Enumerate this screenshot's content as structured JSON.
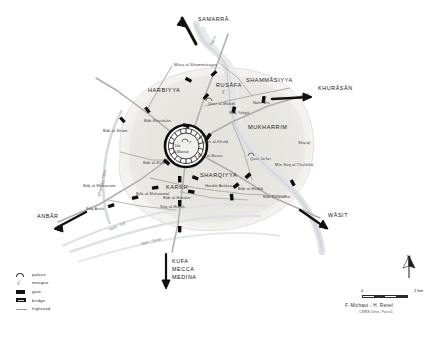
{
  "map": {
    "title": "Baghdad - Round City of al-Mansur",
    "central_city": {
      "name_line1": "Dār",
      "name_line2": "al-Mansūr"
    },
    "districts": [
      {
        "label": "HARBIYYA",
        "x": 150,
        "y": 91
      },
      {
        "label": "RUSĀFA",
        "x": 219,
        "y": 86
      },
      {
        "label": "SHAMMĀSIYYA",
        "x": 249,
        "y": 81
      },
      {
        "label": "MUKHARRIM",
        "x": 250,
        "y": 128
      },
      {
        "label": "SHARQIYYA",
        "x": 201,
        "y": 176
      },
      {
        "label": "KARKH",
        "x": 168,
        "y": 188
      }
    ],
    "destinations": [
      {
        "label": "SAMARRĀ",
        "x": 200,
        "y": 20
      },
      {
        "label": "KHURĀSĀN",
        "x": 321,
        "y": 89
      },
      {
        "label": "WĀSIT",
        "x": 331,
        "y": 216
      },
      {
        "label": "ANBĀR",
        "x": 39,
        "y": 217
      },
      {
        "label": "KUFA",
        "x": 172,
        "y": 261
      },
      {
        "label": "MECCA",
        "x": 172,
        "y": 269
      },
      {
        "label": "MEDINA",
        "x": 172,
        "y": 277
      }
    ],
    "places": [
      {
        "label": "Bāb al-Shām",
        "x": 105,
        "y": 131
      },
      {
        "label": "Bāb Khurāsān",
        "x": 146,
        "y": 121
      },
      {
        "label": "Bāb al-Kūfa",
        "x": 145,
        "y": 163
      },
      {
        "label": "Bāb al-Basra",
        "x": 199,
        "y": 156
      },
      {
        "label": "Qasr al-Khuld",
        "x": 203,
        "y": 142
      },
      {
        "label": "Qasr al-Mahdī",
        "x": 209,
        "y": 104
      },
      {
        "label": "Qasr Ja'far",
        "x": 252,
        "y": 159
      },
      {
        "label": "Bāb al-Muhawwal",
        "x": 139,
        "y": 194
      },
      {
        "label": "Bāb al-Harrāni",
        "x": 164,
        "y": 198
      },
      {
        "label": "Mūsa al-Shammāsiyya",
        "x": 176,
        "y": 65
      },
      {
        "label": "Sūq Yahyā",
        "x": 231,
        "y": 113
      },
      {
        "label": "Nahr Bīn",
        "x": 255,
        "y": 103
      },
      {
        "label": "Mīn Sūq al-Thulāthā",
        "x": 277,
        "y": 165
      },
      {
        "label": "Hardāt Antāsa",
        "x": 207,
        "y": 186
      },
      {
        "label": "Sūq al-Hursh",
        "x": 162,
        "y": 207
      },
      {
        "label": "Bāb al-Hadīd",
        "x": 240,
        "y": 189
      },
      {
        "label": "Bāb Kalwadhā",
        "x": 265,
        "y": 197
      },
      {
        "label": "Bāb al-Muharram",
        "x": 85,
        "y": 186
      },
      {
        "label": "Sūq Arish",
        "x": 88,
        "y": 209
      },
      {
        "label": "Sharqī",
        "x": 300,
        "y": 143
      }
    ],
    "waterways": [
      {
        "label": "Khandaq Tāhir",
        "x": 98,
        "y": 196
      },
      {
        "label": "Nahr ʿĪsā",
        "x": 109,
        "y": 229
      },
      {
        "label": "Nahr Sarāt",
        "x": 141,
        "y": 243
      },
      {
        "label": "Tigris",
        "x": 210,
        "y": 45
      }
    ],
    "legend": {
      "items": [
        {
          "symbol": "palace-icon",
          "label": "palace"
        },
        {
          "symbol": "mosque-icon",
          "label": "mosque"
        },
        {
          "symbol": "gate-icon",
          "label": "gate"
        },
        {
          "symbol": "bridge-icon",
          "label": "bridge"
        },
        {
          "symbol": "highroad-icon",
          "label": "highroad"
        }
      ]
    },
    "scale": {
      "start": "0",
      "end": "2 km"
    },
    "compass": {
      "label": "N"
    },
    "credit": {
      "authors": "F. Michaut - H. Renel",
      "affiliation": "CNRS Univ. Paris1"
    },
    "colors": {
      "land": "#e8e6e1",
      "water": "#f2f3f4",
      "road": "#b2b0ac",
      "ink": "#1d1d1d",
      "wall": "#0e0e0e"
    }
  }
}
